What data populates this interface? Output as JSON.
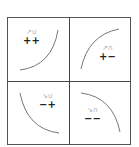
{
  "diagram": {
    "title": "",
    "quadrants": [
      {
        "position": "top-left",
        "direction_glyph": "↗",
        "concavity_glyph": "∪",
        "glyphs": "↗∪",
        "signs": "++",
        "description": "increasing, concave up"
      },
      {
        "position": "top-right",
        "direction_glyph": "↗",
        "concavity_glyph": "∩",
        "glyphs": "↗∩",
        "signs": "+−",
        "description": "increasing, concave down"
      },
      {
        "position": "bottom-left",
        "direction_glyph": "↘",
        "concavity_glyph": "∪",
        "glyphs": "↘∪",
        "signs": "−+",
        "description": "decreasing, concave up"
      },
      {
        "position": "bottom-right",
        "direction_glyph": "↘",
        "concavity_glyph": "∩",
        "glyphs": "↘∩",
        "signs": "−−",
        "description": "decreasing, concave down"
      }
    ],
    "colors": {
      "frame": "#555555",
      "curve": "#777777",
      "sign_text": "#222222",
      "glyph_text": "#aaaaaa"
    }
  }
}
